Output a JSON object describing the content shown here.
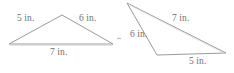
{
  "figure": {
    "unit": "in.",
    "stroke_color": "#9a9a9e",
    "text_color": "#6f7073",
    "background_color": "#ffffff"
  },
  "triangles": [
    {
      "id": "left-triangle",
      "name": "Triangle 1",
      "vertices": [
        {
          "name": "left-vertex",
          "x": 9,
          "y": 44
        },
        {
          "name": "apex-vertex",
          "x": 62,
          "y": 15
        },
        {
          "name": "right-vertex",
          "x": 113,
          "y": 44
        }
      ],
      "sides": [
        {
          "name": "left-side",
          "label": "5 in.",
          "length": 5
        },
        {
          "name": "right-side",
          "label": "6 in.",
          "length": 6
        },
        {
          "name": "base-side",
          "label": "7 in.",
          "length": 7
        }
      ]
    },
    {
      "id": "right-triangle",
      "name": "Triangle 2",
      "vertices": [
        {
          "name": "top-vertex",
          "x": 127,
          "y": 3
        },
        {
          "name": "bottom-left-vertex",
          "x": 157,
          "y": 55
        },
        {
          "name": "right-vertex",
          "x": 226,
          "y": 53
        }
      ],
      "sides": [
        {
          "name": "upper-side",
          "label": "7 in.",
          "length": 7
        },
        {
          "name": "left-side",
          "label": "6 in.",
          "length": 6
        },
        {
          "name": "bottom-side",
          "label": "5 in.",
          "length": 5
        }
      ]
    }
  ],
  "labels": {
    "left_five": "5 in.",
    "left_six": "6 in.",
    "left_seven": "7 in.",
    "right_seven": "7 in.",
    "right_six": "6 in.",
    "right_five": "5 in."
  }
}
